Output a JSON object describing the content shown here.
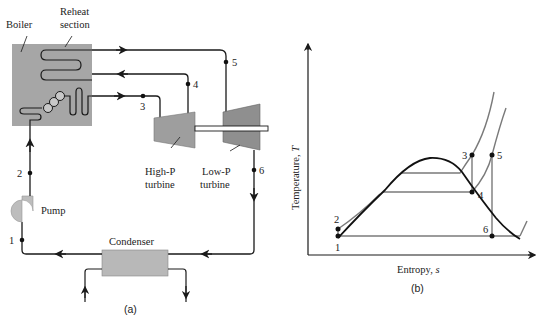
{
  "figure_a": {
    "caption": "(a)",
    "labels": {
      "boiler": "Boiler",
      "reheat_line1": "Reheat",
      "reheat_line2": "section",
      "pump": "Pump",
      "condenser": "Condenser",
      "hp_line1": "High-P",
      "hp_line2": "turbine",
      "lp_line1": "Low-P",
      "lp_line2": "turbine"
    },
    "state_points": [
      "1",
      "2",
      "3",
      "4",
      "5",
      "6"
    ],
    "colors": {
      "boiler_fill": "#a6a6a6",
      "turbine_fill": "#9e9e9e",
      "condenser_fill": "#b8b8b8",
      "pump_fill": "#bdbdbd",
      "line": "#1a1a1a"
    }
  },
  "figure_b": {
    "caption": "(b)",
    "xlabel": "Entropy, ",
    "xlabel_var": "s",
    "ylabel": "Temperature, ",
    "ylabel_var": "T",
    "state_points": [
      "1",
      "2",
      "3",
      "4",
      "5",
      "6"
    ]
  }
}
